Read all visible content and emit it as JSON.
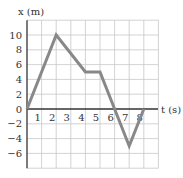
{
  "chart_data": {
    "type": "line",
    "title": "",
    "xlabel": "t (s)",
    "ylabel": "x (m)",
    "x": [
      0,
      2,
      4,
      5,
      7,
      8
    ],
    "series": [
      {
        "name": "position",
        "values": [
          0,
          10,
          5,
          5,
          -5,
          0
        ],
        "color": "#888888"
      }
    ],
    "x_ticks": [
      "1",
      "2",
      "3",
      "4",
      "5",
      "6",
      "7",
      "8"
    ],
    "y_ticks": [
      "10",
      "8",
      "6",
      "4",
      "2",
      "0",
      "−2",
      "−4",
      "−6"
    ],
    "xlim": [
      0,
      9
    ],
    "ylim": [
      -8,
      12
    ],
    "grid": true,
    "legend": "none"
  },
  "labels": {
    "y_axis": "x (m)",
    "x_axis": "t (s)"
  }
}
